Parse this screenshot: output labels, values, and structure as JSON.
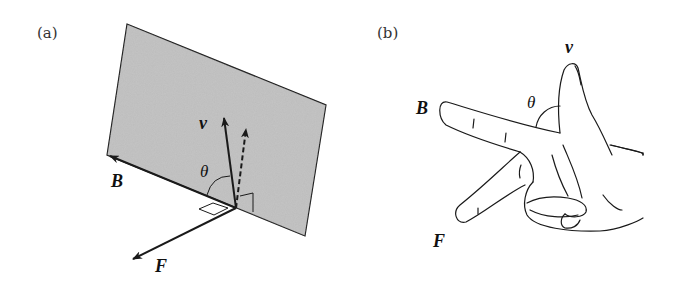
{
  "figure": {
    "panels": [
      {
        "id": "a",
        "label": "(a)",
        "description": "Charged particle velocity v at angle theta to magnetic field B lying in a plane; force F perpendicular to plane",
        "vectors": {
          "velocity": "v",
          "field": "B",
          "force": "F",
          "angle": "θ"
        }
      },
      {
        "id": "b",
        "label": "(b)",
        "description": "Hand rule: index finger B, middle/upright finger v, finger pointing down-left F, angle theta between B and v",
        "vectors": {
          "velocity": "v",
          "field": "B",
          "force": "F",
          "angle": "θ"
        }
      }
    ]
  },
  "colors": {
    "plane_fill": "#bdbdbd",
    "stroke": "#1a1a1a",
    "background": "#ffffff"
  }
}
